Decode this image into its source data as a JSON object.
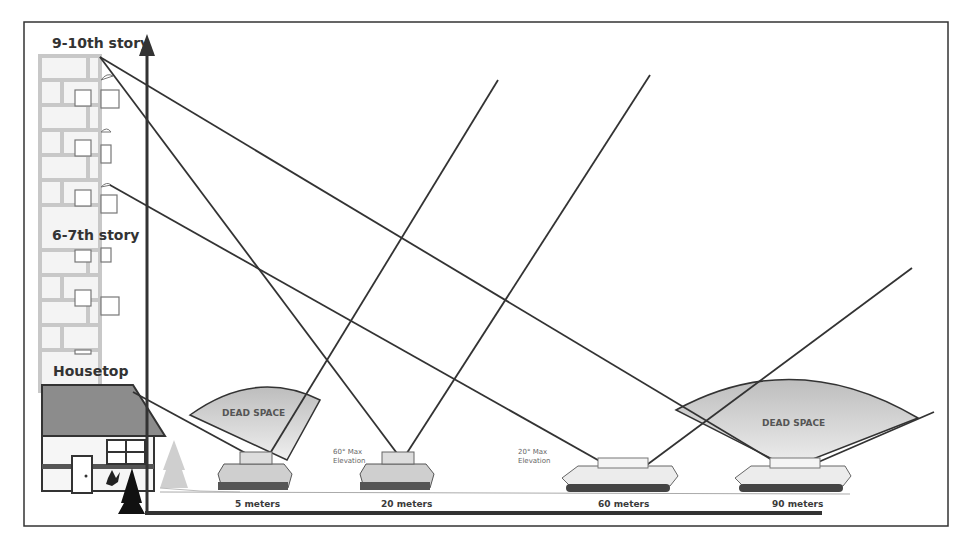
{
  "figure": {
    "building_labels": {
      "top": "9-10th story",
      "middle": "6-7th story",
      "house": "Housetop"
    },
    "dead_space_labels": [
      "DEAD SPACE",
      "DEAD SPACE"
    ],
    "elevation_notes": [
      {
        "angle": "60° Max",
        "label": "Elevation"
      },
      {
        "angle": "20° Max",
        "label": "Elevation"
      }
    ],
    "distance_labels": [
      "5 meters",
      "20 meters",
      "60 meters",
      "90 meters"
    ],
    "vehicles": [
      {
        "type": "infantry-fighting-vehicle",
        "distance": "5 meters"
      },
      {
        "type": "infantry-fighting-vehicle",
        "distance": "20 meters",
        "max_elevation": "60°"
      },
      {
        "type": "main-battle-tank",
        "distance": "60 meters",
        "max_elevation": "20°"
      },
      {
        "type": "main-battle-tank",
        "distance": "90 meters"
      }
    ],
    "colors": {
      "line": "#333333",
      "building_fill": "#e0e0e0",
      "roof_fill": "#8c8c8c",
      "dead_space_fill": "#d4d4d4",
      "frame": "#333333"
    }
  }
}
